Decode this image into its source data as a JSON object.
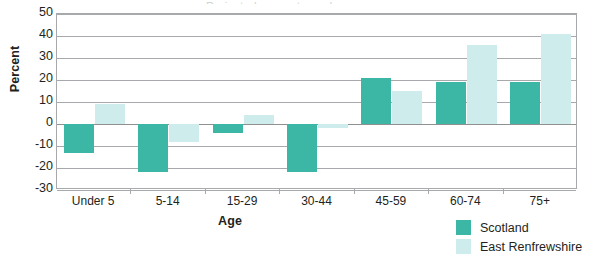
{
  "chart_data": {
    "type": "bar",
    "title": "",
    "xlabel": "Age",
    "ylabel": "Percent",
    "ylim": [
      -30,
      50
    ],
    "yticks": [
      50,
      40,
      30,
      20,
      10,
      0,
      -10,
      -20,
      -30
    ],
    "grid": true,
    "legend_position": "bottom-right",
    "categories": [
      "Under 5",
      "5-14",
      "15-29",
      "30-44",
      "45-59",
      "60-74",
      "75+"
    ],
    "series": [
      {
        "name": "Scotland",
        "color": "#3cb6a5",
        "values": [
          -13,
          -22,
          -4,
          -22,
          21,
          19,
          19
        ]
      },
      {
        "name": "East Renfrewshire",
        "color": "#cdeceb",
        "values": [
          9,
          -8,
          4,
          -2,
          15,
          36,
          41
        ]
      }
    ]
  },
  "axis": {
    "y_title": "Percent",
    "x_title": "Age"
  },
  "title_remnant": "Projected percentage change"
}
